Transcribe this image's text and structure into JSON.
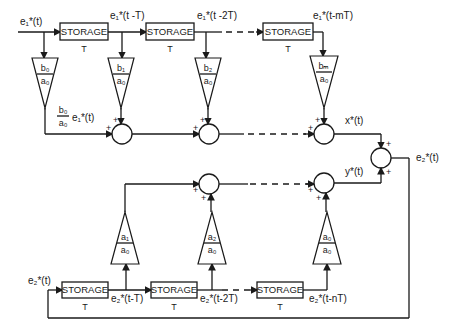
{
  "diagram": {
    "storage_label": "STORAGE",
    "delay_label": "T",
    "forward": {
      "input_label": "e₁*(t)",
      "taps": [
        {
          "signal": "e₁*(t)",
          "gain_num": "b₀",
          "gain_den": "a₀"
        },
        {
          "signal": "e₁*(t -T)",
          "gain_num": "b₁",
          "gain_den": "a₀"
        },
        {
          "signal": "e₁*(t -2T)",
          "gain_num": "b₂",
          "gain_den": "a₀"
        },
        {
          "signal": "e₁*(t-mT)",
          "gain_num": "bₘ",
          "gain_den": "a₀"
        }
      ],
      "first_product_num": "b₀",
      "first_product_den": "a₀",
      "first_product_sig": "e₁*(t)",
      "output_label": "x*(t)"
    },
    "feedback": {
      "taps": [
        {
          "signal": "e₂*(t-T)",
          "gain_num": "a₁",
          "gain_den": "a₀"
        },
        {
          "signal": "e₂*(t-2T)",
          "gain_num": "a₂",
          "gain_den": "a₀"
        },
        {
          "signal": "e₂*(t-nT)",
          "gain_num": "a₀",
          "gain_den": "a₀"
        }
      ],
      "input_label": "e₂*(t)",
      "output_label": "y*(t)"
    },
    "final_output_label": "e₂*(t)",
    "plus_sign": "+"
  }
}
